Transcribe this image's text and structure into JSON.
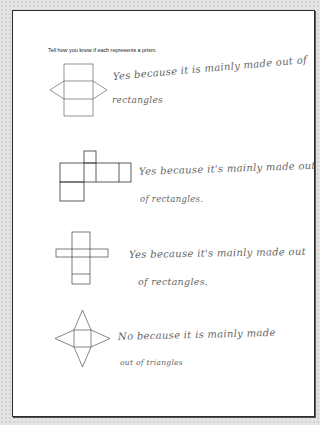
{
  "worksheet": {
    "prompt": "Tell how you know if each represents a prism.",
    "items": [
      {
        "figure": "triangular-prism-net",
        "answer_line1": "Yes because it is mainly made out of",
        "answer_line2": "rectangles"
      },
      {
        "figure": "rectangular-prism-net-horizontal",
        "answer_line1": "Yes because it's mainly made out",
        "answer_line2": "of rectangles."
      },
      {
        "figure": "rectangular-prism-net-cross",
        "answer_line1": "Yes because it's mainly made out",
        "answer_line2": "of rectangles."
      },
      {
        "figure": "square-pyramid-net",
        "answer_line1": "No because it is mainly made",
        "answer_line2": "out of triangles"
      }
    ]
  },
  "colors": {
    "background": "#e4e4e4",
    "page": "#ffffff",
    "border": "#2a2a2a",
    "figure_stroke": "#555555",
    "handwriting": "#666666"
  }
}
